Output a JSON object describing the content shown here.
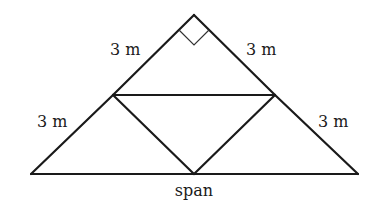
{
  "diagram": {
    "type": "truss",
    "labels": {
      "top_left_side": "3 m",
      "top_right_side": "3 m",
      "bottom_left_side": "3 m",
      "bottom_right_side": "3 m",
      "base": "span"
    },
    "nodes": {
      "apex": [
        194,
        15
      ],
      "left_mid": [
        113,
        95
      ],
      "right_mid": [
        275,
        95
      ],
      "bottom_left": [
        31,
        174
      ],
      "bottom_mid": [
        194,
        174
      ],
      "bottom_right": [
        358,
        174
      ]
    },
    "right_angle_marker": "at apex",
    "colors": {
      "line": "#1a1a1a",
      "background": "#ffffff"
    }
  }
}
